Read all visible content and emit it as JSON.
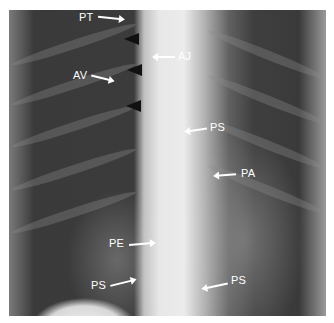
{
  "figure": {
    "type": "chest radiograph (frontal view)",
    "labels": {
      "pt": "PT",
      "aj": "AJ",
      "av": "AV",
      "ps_right_mid": "PS",
      "pa": "PA",
      "pe": "PE",
      "ps_left_low": "PS",
      "ps_right_low": "PS"
    },
    "arrowhead_count": 3,
    "colors": {
      "annotation": "#ffffff",
      "arrowhead": "#111111",
      "background": "#ffffff"
    }
  }
}
